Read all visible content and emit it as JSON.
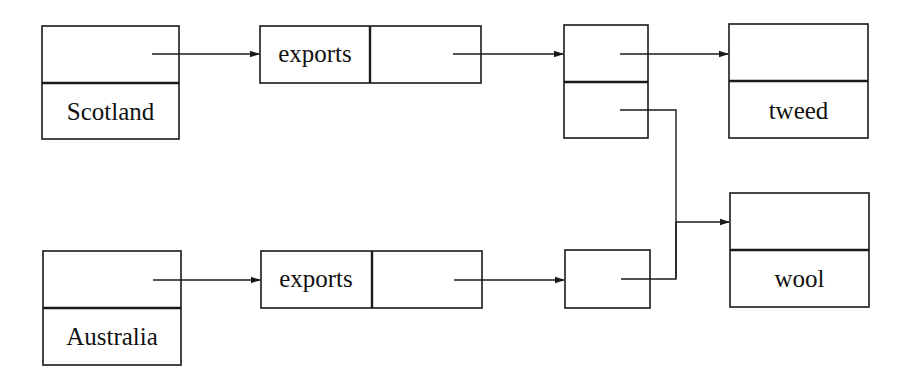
{
  "diagram": {
    "type": "linked-structure",
    "nodes": {
      "scotland": {
        "kind": "two-slot-vertical",
        "slots": [
          "",
          "Scotland"
        ]
      },
      "scotland_exports": {
        "kind": "two-slot-horizontal",
        "slots": [
          "exports",
          ""
        ]
      },
      "scotland_list": {
        "kind": "two-slot-vertical",
        "slots": [
          "",
          ""
        ]
      },
      "tweed": {
        "kind": "two-slot-vertical",
        "slots": [
          "",
          "tweed"
        ]
      },
      "wool": {
        "kind": "two-slot-vertical",
        "slots": [
          "",
          "wool"
        ]
      },
      "australia": {
        "kind": "two-slot-vertical",
        "slots": [
          "",
          "Australia"
        ]
      },
      "australia_exports": {
        "kind": "two-slot-horizontal",
        "slots": [
          "exports",
          ""
        ]
      },
      "australia_list": {
        "kind": "single-slot",
        "slots": [
          ""
        ]
      }
    },
    "edges": [
      {
        "from": "scotland.slot0",
        "to": "scotland_exports"
      },
      {
        "from": "scotland_exports.slot1",
        "to": "scotland_list"
      },
      {
        "from": "scotland_list.slot0",
        "to": "tweed"
      },
      {
        "from": "scotland_list.slot1",
        "to": "wool"
      },
      {
        "from": "australia.slot0",
        "to": "australia_exports"
      },
      {
        "from": "australia_exports.slot1",
        "to": "australia_list"
      },
      {
        "from": "australia_list.slot0",
        "to": "wool"
      }
    ]
  },
  "labels": {
    "scotland": "Scotland",
    "scotland_exports": "exports",
    "tweed": "tweed",
    "wool": "wool",
    "australia": "Australia",
    "australia_exports": "exports"
  }
}
